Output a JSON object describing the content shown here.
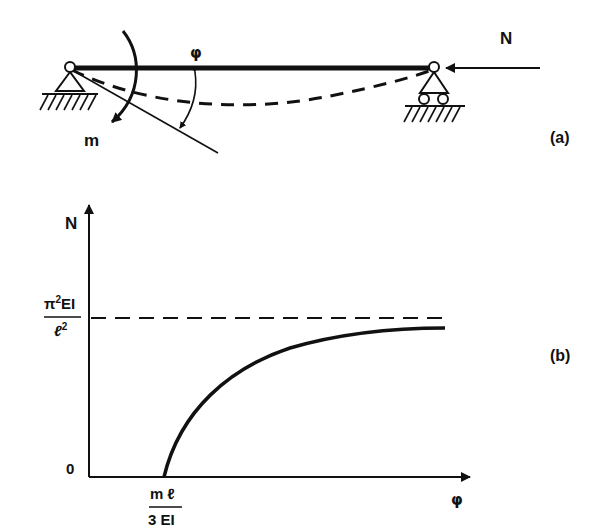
{
  "panel_a": {
    "label": "(a)",
    "axial_force_label": "N",
    "moment_label": "m",
    "rotation_label": "φ"
  },
  "panel_b": {
    "label": "(b)",
    "y_axis_label": "N",
    "x_axis_label": "φ",
    "origin_label": "0",
    "asymptote_label": {
      "numerator": "π²EI",
      "numerator_base": "π",
      "numerator_sup": "2",
      "numerator_rest": "EI",
      "denominator": "ℓ²",
      "denominator_base": "ℓ",
      "denominator_sup": "2"
    },
    "x_intercept_label": {
      "numerator": "m ℓ",
      "denominator": "3 EI"
    }
  },
  "chart_data": {
    "type": "line",
    "title": "",
    "xlabel": "φ",
    "ylabel": "N",
    "series": [
      {
        "name": "N vs φ",
        "description": "Curve starts at φ = mℓ/(3EI), N = 0 and rises concavely, approaching the Euler load asymptotically",
        "points_normalized": [
          [
            0.0,
            0.0
          ],
          [
            0.05,
            0.35
          ],
          [
            0.15,
            0.6
          ],
          [
            0.3,
            0.78
          ],
          [
            0.5,
            0.88
          ],
          [
            0.75,
            0.93
          ],
          [
            1.0,
            0.95
          ]
        ]
      }
    ],
    "annotations": [
      {
        "type": "horizontal-dashed-asymptote",
        "value": "π²EI/ℓ²"
      },
      {
        "type": "x-intercept",
        "value": "mℓ/(3EI)"
      },
      {
        "type": "origin",
        "value": "0"
      }
    ],
    "grid": false
  }
}
